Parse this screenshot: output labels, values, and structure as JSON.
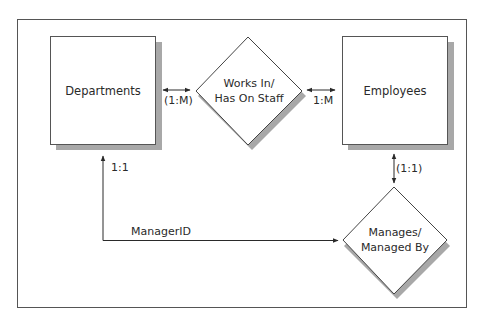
{
  "diagram": {
    "type": "entity-relationship",
    "entities": [
      {
        "id": "departments",
        "label": "Departments"
      },
      {
        "id": "employees",
        "label": "Employees"
      }
    ],
    "relationships": [
      {
        "id": "works_in",
        "line1": "Works In/",
        "line2": "Has On Staff"
      },
      {
        "id": "manages",
        "line1": "Manages/",
        "line2": "Managed By"
      }
    ],
    "cardinalities": {
      "departments_works_in": "(1:M)",
      "works_in_employees": "1:M",
      "departments_manager": "1:1",
      "employees_manages": "(1:1)"
    },
    "connector_labels": {
      "manager_id": "ManagerID"
    },
    "colors": {
      "line": "#3a3a3a",
      "shadow": "#a8a8a8",
      "fill": "#ffffff"
    }
  }
}
